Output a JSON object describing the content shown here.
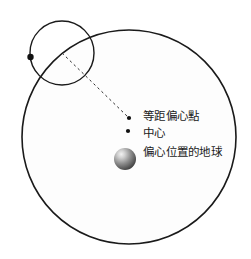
{
  "diagram": {
    "type": "ptolemaic-equant-diagram",
    "background_color": "#ffffff",
    "stroke_color": "#1a1a1a",
    "deferent": {
      "name": "deferent-circle",
      "cx": 129,
      "cy": 137,
      "r": 107,
      "stroke_width": 1.6,
      "fill": "#fdfdfd"
    },
    "epicycle": {
      "name": "epicycle-circle",
      "cx": 62,
      "cy": 53,
      "r": 32,
      "stroke_width": 1.4,
      "fill": "none"
    },
    "planet_marker": {
      "name": "planet-dot",
      "cx": 30.5,
      "cy": 57,
      "r": 3.2,
      "color": "#111111"
    },
    "equant_dot": {
      "name": "equant-point-dot",
      "cx": 129,
      "cy": 118,
      "r": 2.1,
      "color": "#111111"
    },
    "center_dot": {
      "name": "center-point-dot",
      "cx": 128,
      "cy": 131,
      "r": 2.1,
      "color": "#111111"
    },
    "earth_sphere": {
      "name": "earth-sphere",
      "cx": 125,
      "cy": 159,
      "r": 11,
      "highlight_color": "#e8e8e8",
      "mid_color": "#9a9a9a",
      "edge_color": "#4a4a4a"
    },
    "equant_line": {
      "name": "equant-dashed-line",
      "x1": 62,
      "y1": 53,
      "x2": 129,
      "y2": 118,
      "dash": "2.5 3",
      "stroke_width": 1,
      "color": "#2a2a2a"
    }
  },
  "labels": {
    "equant": "等距偏心點",
    "center": "中心",
    "earth": "偏心位置的地球"
  }
}
